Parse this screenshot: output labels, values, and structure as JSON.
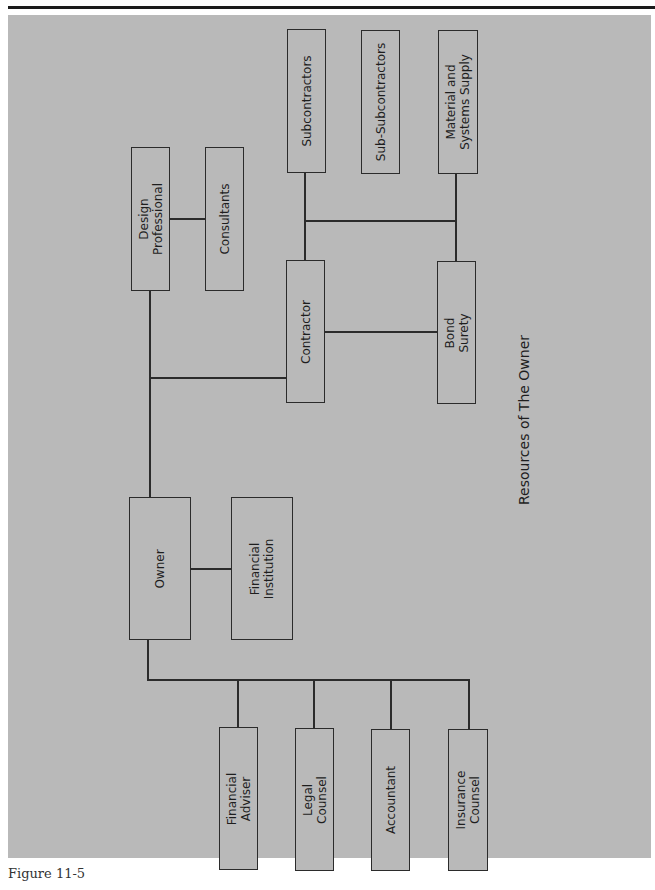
{
  "diagram": {
    "title": "Resources of The Owner",
    "caption": "Figure 11-5",
    "colors": {
      "panel": "#b9b9b9",
      "line": "#2b2b2b",
      "text": "#1e1e1e"
    },
    "nodes": {
      "design_professional": "Design\nProfessional",
      "consultants": "Consultants",
      "subcontractors": "Subcontractors",
      "sub_subcontractors": "Sub-Subcontractors",
      "material_supply": "Material and\nSystems Supply",
      "contractor": "Contractor",
      "bond_surety": "Bond\nSurety",
      "owner": "Owner",
      "financial_institution": "Financial\nInstitution",
      "financial_adviser": "Financial\nAdviser",
      "legal_counsel": "Legal\nCounsel",
      "accountant": "Accountant",
      "insurance_counsel": "Insurance\nCounsel"
    },
    "edges": [
      [
        "design_professional",
        "consultants"
      ],
      [
        "design_professional",
        "owner"
      ],
      [
        "owner",
        "contractor"
      ],
      [
        "contractor",
        "bond_surety"
      ],
      [
        "contractor",
        "subcontractors"
      ],
      [
        "subcontractors",
        "material_supply"
      ],
      [
        "material_supply",
        "bond_surety"
      ],
      [
        "owner",
        "financial_institution"
      ],
      [
        "owner",
        "financial_adviser"
      ],
      [
        "owner",
        "legal_counsel"
      ],
      [
        "owner",
        "accountant"
      ],
      [
        "owner",
        "insurance_counsel"
      ]
    ]
  }
}
